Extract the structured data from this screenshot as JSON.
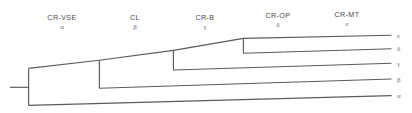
{
  "figure": {
    "type": "cladogram",
    "title": "",
    "background_color": "#ffffff",
    "line_color": "#5a5a5a",
    "text_color": "#4a4a4a",
    "width": 412,
    "height": 113
  },
  "column_headers": [
    {
      "name": "CR-VSE",
      "greek": "α",
      "x": 62
    },
    {
      "name": "CL",
      "greek": "β",
      "x": 135
    },
    {
      "name": "CR-B",
      "greek": "γ",
      "x": 205
    },
    {
      "name": "CR-OP",
      "greek": "δ",
      "x": 278
    },
    {
      "name": "CR-MT",
      "greek": "ε",
      "x": 347
    }
  ],
  "leaves": [
    {
      "label": "ε",
      "y": 38,
      "branch_start_x": 243,
      "branch_end_x": 392
    },
    {
      "label": "δ",
      "y": 52,
      "branch_start_x": 243,
      "branch_end_x": 392
    },
    {
      "label": "γ",
      "y": 68,
      "branch_start_x": 173,
      "branch_end_x": 392
    },
    {
      "label": "β",
      "y": 87,
      "branch_start_x": 99,
      "branch_end_x": 392
    },
    {
      "label": "α",
      "y": 105,
      "branch_start_x": 28,
      "branch_end_x": 392
    }
  ],
  "nodes": [
    {
      "name": "root",
      "x": 28,
      "y_top": 68,
      "y_bottom": 105,
      "stem_from_x": 10,
      "stem_y": 87
    },
    {
      "name": "node2",
      "x": 99,
      "y_top": 60,
      "y_bottom": 88,
      "stem_from_x": 28,
      "stem_y": 68
    },
    {
      "name": "node3",
      "x": 173,
      "y_top": 50,
      "y_bottom": 70,
      "stem_from_x": 99,
      "stem_y": 60
    },
    {
      "name": "node4",
      "x": 243,
      "y_top": 38,
      "y_bottom": 53,
      "stem_from_x": 173,
      "stem_y": 50
    }
  ]
}
